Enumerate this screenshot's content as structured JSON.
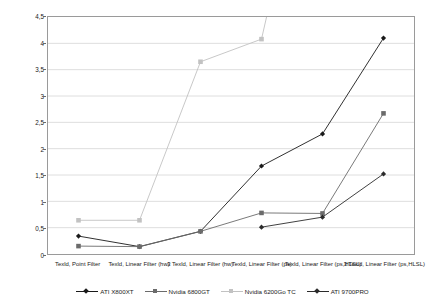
{
  "chart_data": {
    "type": "line",
    "title": "",
    "xlabel": "",
    "ylabel": "Time (in sec) for 1500 Quads (512x512)",
    "ylim": [
      0,
      4.5
    ],
    "ytick_step": 0.5,
    "grid": true,
    "legend_position": "bottom",
    "decimal_separator": ",",
    "categories": [
      "Texld, Point Filter",
      "Texld, Linear Filter (hw)",
      "3 Texld, Linear Filter (hw)",
      "Texld, Linear Filter (ps)",
      "Texld, Linear Filter (ps,HLSL)",
      "3 Texld, Linear Filter (ps,HLSL)"
    ],
    "ytick_labels": [
      "0",
      "0,5",
      "1",
      "1,5",
      "2",
      "2,5",
      "3",
      "3,5",
      "4",
      "4,5"
    ],
    "ytick_values": [
      0,
      0.5,
      1,
      1.5,
      2,
      2.5,
      3,
      3.5,
      4,
      4.5
    ],
    "series": [
      {
        "name": "ATI X800XT",
        "color": "#1a1a1a",
        "marker": "diamond",
        "values": [
          0.34,
          0.14,
          0.43,
          1.67,
          2.28,
          4.1
        ]
      },
      {
        "name": "Nvidia 6800GT",
        "color": "#6b6b6b",
        "marker": "square",
        "values": [
          0.15,
          0.14,
          0.43,
          0.78,
          0.77,
          2.67
        ]
      },
      {
        "name": "Nvidia 6200Go TC",
        "color": "#c2c2c2",
        "marker": "square",
        "values": [
          0.64,
          0.64,
          3.65,
          4.08,
          null,
          null
        ],
        "note": "exceeds axis maximum after 4th category"
      },
      {
        "name": "ATI 9700PRO",
        "color": "#2b2b2b",
        "marker": "diamond",
        "values": [
          null,
          null,
          null,
          0.51,
          0.7,
          1.52
        ]
      }
    ]
  },
  "legend": {
    "entries": [
      "ATI X800XT",
      "Nvidia 6800GT",
      "Nvidia 6200Go TC",
      "ATI 9700PRO"
    ]
  }
}
